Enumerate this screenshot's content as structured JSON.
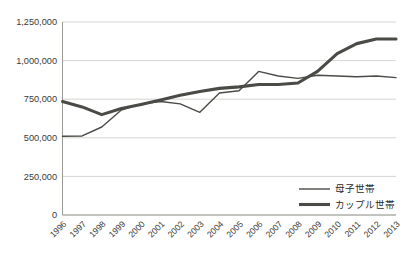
{
  "chart_data": {
    "type": "line",
    "title": "",
    "subtitle": "",
    "xlabel": "",
    "ylabel": "",
    "x": [
      1996,
      1997,
      1998,
      1999,
      2000,
      2001,
      2002,
      2003,
      2004,
      2005,
      2006,
      2007,
      2008,
      2009,
      2010,
      2011,
      2012,
      2013
    ],
    "categories": [
      "1996",
      "1997",
      "1998",
      "1999",
      "2000",
      "2001",
      "2002",
      "2003",
      "2004",
      "2005",
      "2006",
      "2007",
      "2008",
      "2009",
      "2010",
      "2011",
      "2012",
      "2013"
    ],
    "series": [
      {
        "name": "母子世帯",
        "style": "thin",
        "color": "#4a4a46",
        "values": [
          510000,
          512000,
          570000,
          680000,
          720000,
          735000,
          720000,
          665000,
          790000,
          805000,
          930000,
          900000,
          885000,
          905000,
          900000,
          895000,
          900000,
          890000
        ]
      },
      {
        "name": "カップル世帯",
        "style": "thick",
        "color": "#4a4a46",
        "values": [
          735000,
          700000,
          650000,
          690000,
          715000,
          745000,
          775000,
          800000,
          820000,
          830000,
          845000,
          845000,
          855000,
          930000,
          1045000,
          1110000,
          1140000,
          1140000
        ]
      }
    ],
    "ylim": [
      0,
      1250000
    ],
    "ytick_values": [
      0,
      250000,
      500000,
      750000,
      1000000,
      1250000
    ],
    "ytick_labels": [
      "0",
      "250,000",
      "500,000",
      "750,000",
      "1,000,000",
      "1,250,000"
    ],
    "grid": true,
    "grid_axis": "y",
    "legend_position": "bottom-right",
    "legend": [
      {
        "label": "母子世帯",
        "style": "thin"
      },
      {
        "label": "カップル世帯",
        "style": "thick"
      }
    ],
    "xtick_rotation": -45,
    "colors": {
      "line": "#4a4a46",
      "grid": "#c9c9c4",
      "axis": "#9b9b95",
      "text": "#3a3a38",
      "background": "#ffffff"
    }
  }
}
